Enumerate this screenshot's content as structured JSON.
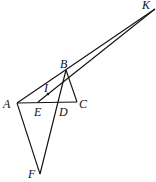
{
  "diagram": {
    "points": {
      "A": {
        "label": "A",
        "x": 17,
        "y": 103
      },
      "B": {
        "label": "B",
        "x": 66,
        "y": 70
      },
      "C": {
        "label": "C",
        "x": 77,
        "y": 102
      },
      "D": {
        "label": "D",
        "x": 59,
        "y": 102
      },
      "E": {
        "label": "E",
        "x": 38,
        "y": 102
      },
      "F": {
        "label": "F",
        "x": 40,
        "y": 174
      },
      "I": {
        "label": "I",
        "x": 48,
        "y": 94
      },
      "K": {
        "label": "K",
        "x": 155,
        "y": 9
      }
    },
    "segments": [
      [
        "A",
        "B"
      ],
      [
        "A",
        "C"
      ],
      [
        "B",
        "C"
      ],
      [
        "B",
        "F"
      ],
      [
        "A",
        "F"
      ],
      [
        "A",
        "K"
      ],
      [
        "E",
        "K"
      ],
      [
        "B",
        "K"
      ]
    ]
  }
}
